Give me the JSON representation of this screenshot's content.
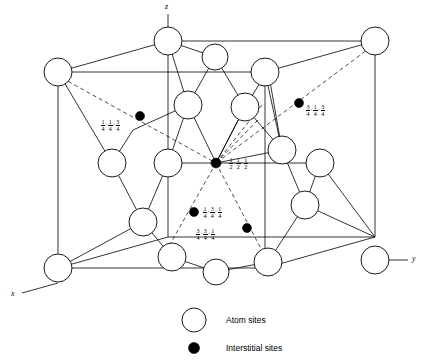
{
  "figure": {
    "type": "crystal-structure-diagram",
    "axes": [
      {
        "name": "x",
        "label": "x"
      },
      {
        "name": "y",
        "label": "y"
      },
      {
        "name": "z",
        "label": "z"
      }
    ],
    "legend": [
      {
        "symbol": "open-circle",
        "label": "Atom sites"
      },
      {
        "symbol": "filled-circle",
        "label": "Interstitial sites"
      }
    ],
    "site_labels": [
      {
        "id": "upper-left",
        "coords": [
          "1/4",
          "1/4",
          "3/4"
        ]
      },
      {
        "id": "upper-right",
        "coords": [
          "3/4",
          "1/4",
          "3/4"
        ]
      },
      {
        "id": "center",
        "coords": [
          "1/2",
          "1/2",
          "1/2"
        ]
      },
      {
        "id": "lower-left",
        "coords": [
          "1/4",
          "3/4",
          "1/4"
        ]
      },
      {
        "id": "lower-right",
        "coords": [
          "3/4",
          "3/4",
          "1/4"
        ]
      }
    ],
    "colors": {
      "line": "#000000",
      "atom_fill": "#ffffff",
      "interstitial_fill": "#000000",
      "background": "#ffffff"
    }
  }
}
